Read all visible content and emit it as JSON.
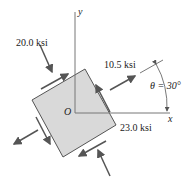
{
  "diagram": {
    "axes": {
      "y_label": "y",
      "x_label": "x",
      "origin_label": "O"
    },
    "stresses": {
      "normal_compressive": "20.0 ksi",
      "shear": "10.5 ksi",
      "normal_tensile": "23.0 ksi"
    },
    "angle": {
      "label": "θ = 30°",
      "value_deg": 30
    },
    "colors": {
      "element_fill": "#d9d9d9",
      "stroke": "#555555"
    }
  }
}
